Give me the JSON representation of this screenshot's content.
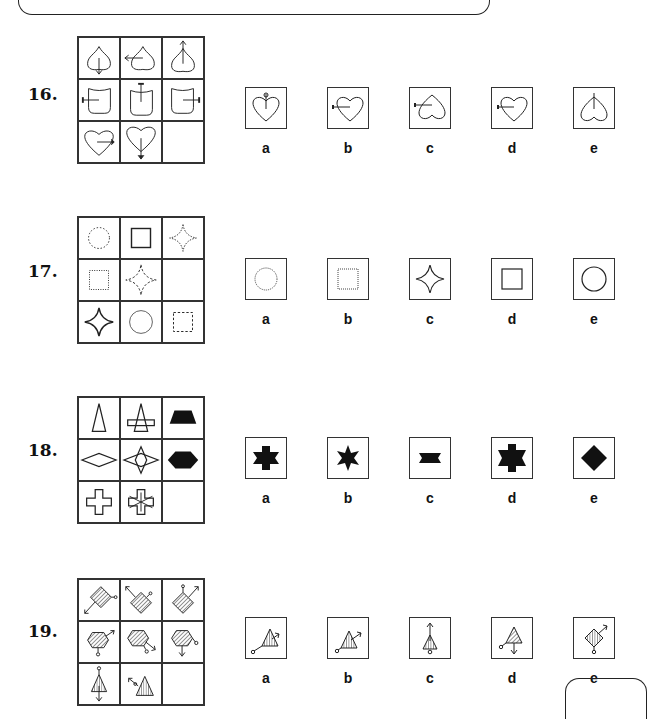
{
  "questions": [
    {
      "number": "16.",
      "grid": [
        "spade-arrow-down",
        "spade-arrow-left",
        "spade-arrow-up",
        "shield-arrow-left",
        "shield-arrow-up",
        "shield-arrow-right",
        "heart-arrow-right",
        "heart-arrow-down",
        ""
      ],
      "options": [
        {
          "label": "a",
          "figure": "heart-arrow-up"
        },
        {
          "label": "b",
          "figure": "heart-arrow-left"
        },
        {
          "label": "c",
          "figure": "inverted-heart-arrow-left"
        },
        {
          "label": "d",
          "figure": "heart-arrow-left-small"
        },
        {
          "label": "e",
          "figure": "inverted-heart-arrow-up"
        }
      ]
    },
    {
      "number": "17.",
      "grid": [
        "dotted-circle",
        "solid-square",
        "dotted-star",
        "dotted-square",
        "dashed-star",
        "",
        "solid-star",
        "solid-circle-thin",
        "dashed-square"
      ],
      "options": [
        {
          "label": "a",
          "figure": "dotted-circle"
        },
        {
          "label": "b",
          "figure": "dotted-square"
        },
        {
          "label": "c",
          "figure": "solid-star"
        },
        {
          "label": "d",
          "figure": "solid-square"
        },
        {
          "label": "e",
          "figure": "solid-circle"
        }
      ]
    },
    {
      "number": "18.",
      "grid": [
        "triangle-outline",
        "triangle-with-bar",
        "black-trapezoid",
        "diamond-outline",
        "diamond-with-star",
        "black-hexagon",
        "cross-outline",
        "cross-with-star",
        ""
      ],
      "options": [
        {
          "label": "a",
          "figure": "black-cross-star"
        },
        {
          "label": "b",
          "figure": "black-star"
        },
        {
          "label": "c",
          "figure": "black-bowtie-bar"
        },
        {
          "label": "d",
          "figure": "black-cross-star-large"
        },
        {
          "label": "e",
          "figure": "black-diamond"
        }
      ]
    },
    {
      "number": "19.",
      "grid": [
        "hatched-diamond-arrow-sw",
        "hatched-diamond-arrow-nw",
        "hatched-diamond-arrow-ne",
        "hatched-hexagon-arrow-ne",
        "hatched-hexagon-arrow-se",
        "hatched-hexagon-arrow-s",
        "hatched-triangle-arrow-s",
        "hatched-triangle-arrow-nw",
        ""
      ],
      "options": [
        {
          "label": "a",
          "figure": "hatched-triangle-circle-sw"
        },
        {
          "label": "b",
          "figure": "hatched-triangle-arrow-ne"
        },
        {
          "label": "c",
          "figure": "hatched-triangle-arrow-up"
        },
        {
          "label": "d",
          "figure": "diag-hatched-triangle-arrow-down"
        },
        {
          "label": "e",
          "figure": "hatched-diamond-arrow-ne"
        }
      ]
    }
  ]
}
